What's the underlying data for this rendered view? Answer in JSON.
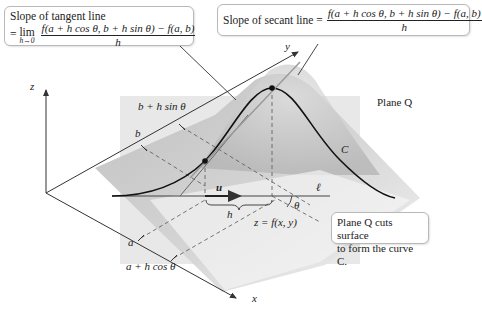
{
  "tangent_callout": {
    "title": "Slope of tangent line",
    "prefix": "=",
    "lim": "lim",
    "lim_sub": "h→0",
    "numerator": "f(a + h cos θ, b + h sin θ) − f(a, b)",
    "denominator": "h"
  },
  "secant_callout": {
    "title": "Slope of secant line =",
    "numerator": "f(a + h cos θ, b + h sin θ) − f(a, b)",
    "denominator": "h"
  },
  "plane_callout": {
    "line1": "Plane Q cuts surface",
    "line2": "to form the curve C."
  },
  "labels": {
    "z_axis": "z",
    "y_axis": "y",
    "x_axis": "x",
    "plane_q": "Plane Q",
    "curve_c": "C",
    "line_l": "ℓ",
    "vector_u": "u",
    "h": "h",
    "theta": "θ",
    "b": "b",
    "b_plus": "b + h sin θ",
    "a": "a",
    "a_plus": "a + h cos θ",
    "surface": "z = f(x, y)"
  },
  "colors": {
    "plane": "#e6e6e6",
    "surface": "#c8c8c8",
    "line": "#333333"
  }
}
